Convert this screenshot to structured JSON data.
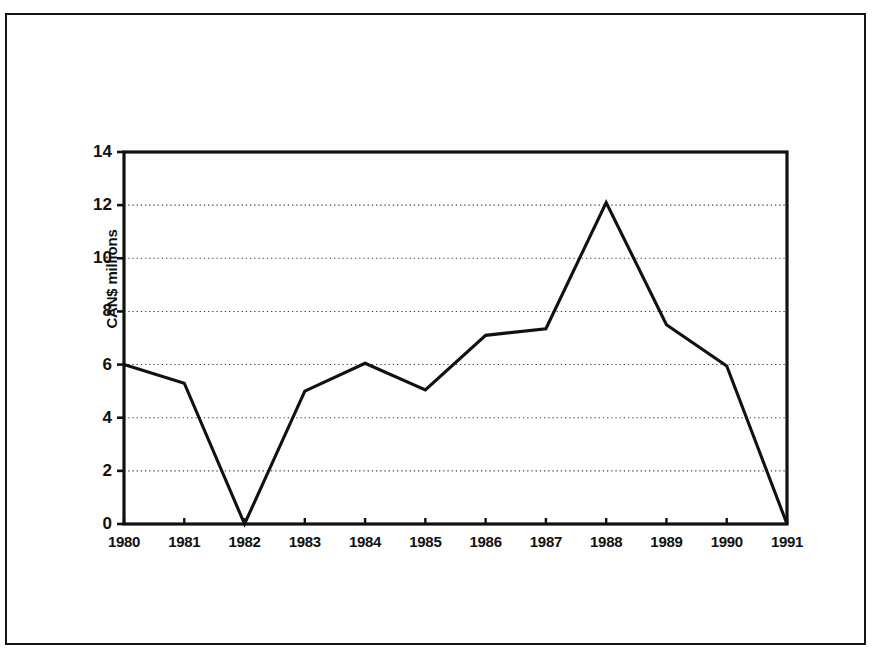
{
  "figure": {
    "background_color": "#ffffff",
    "frame_color": "#151515",
    "line_color": "#111111",
    "gridline_color": "#444444"
  },
  "chart_data": {
    "type": "line",
    "title": "",
    "xlabel": "",
    "ylabel": "CAN$ millions",
    "categories": [
      "1980",
      "1981",
      "1982",
      "1983",
      "1984",
      "1985",
      "1986",
      "1987",
      "1988",
      "1989",
      "1990",
      "1991"
    ],
    "values": [
      6.0,
      5.3,
      0.0,
      5.0,
      6.05,
      5.05,
      7.1,
      7.35,
      12.1,
      7.5,
      5.95,
      0.0
    ],
    "series": [
      {
        "name": "CAN$ millions",
        "values": [
          6.0,
          5.3,
          0.0,
          5.0,
          6.05,
          5.05,
          7.1,
          7.35,
          12.1,
          7.5,
          5.95,
          0.0
        ]
      }
    ],
    "ylim": [
      0,
      14
    ],
    "xlim": [
      "1980",
      "1991"
    ],
    "ytick_labels": [
      "0",
      "2",
      "4",
      "6",
      "8",
      "10",
      "12",
      "14"
    ],
    "ytick_values": [
      0,
      2,
      4,
      6,
      8,
      10,
      12,
      14
    ],
    "xtick_labels": [
      "1980",
      "1981",
      "1982",
      "1983",
      "1984",
      "1985",
      "1986",
      "1987",
      "1988",
      "1989",
      "1990",
      "1991"
    ],
    "gridlines": {
      "horizontal": [
        2,
        4,
        6,
        8,
        10,
        12
      ],
      "vertical": [],
      "style": "dotted"
    },
    "legend": {
      "visible": false,
      "position": "none",
      "entries": []
    },
    "annotations": [],
    "markers": false
  }
}
